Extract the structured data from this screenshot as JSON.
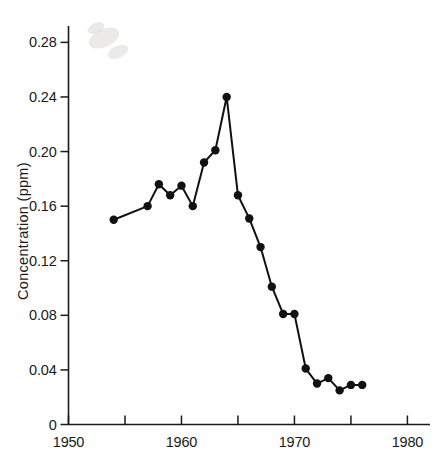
{
  "chart_data": {
    "type": "line",
    "title": "",
    "subtitle": "",
    "xlabel": "",
    "ylabel": "Concentration  (ppm)",
    "xlim": [
      1950,
      1982
    ],
    "ylim": [
      0,
      0.292
    ],
    "grid": false,
    "legend": null,
    "x_ticks_major": [
      1950,
      1960,
      1970,
      1980
    ],
    "x_tick_labels": [
      "1950",
      "1960",
      "1970",
      "1980"
    ],
    "x_ticks_minor": [
      1955,
      1965,
      1975
    ],
    "y_ticks": [
      0,
      0.04,
      0.08,
      0.12,
      0.16,
      0.2,
      0.24,
      0.28
    ],
    "y_tick_labels": [
      "0",
      "0.04",
      "0.08",
      "0.12",
      "0.16",
      "0.20",
      "0.24",
      "0.28"
    ],
    "series": [
      {
        "name": "Concentration",
        "marker": "filled-circle",
        "color": "#111111",
        "x": [
          1954,
          1957,
          1958,
          1959,
          1960,
          1961,
          1962,
          1963,
          1964,
          1965,
          1966,
          1967,
          1968,
          1969,
          1970,
          1971,
          1972,
          1973,
          1974,
          1975,
          1976
        ],
        "values": [
          0.15,
          0.16,
          0.176,
          0.168,
          0.175,
          0.16,
          0.192,
          0.201,
          0.24,
          0.168,
          0.151,
          0.13,
          0.101,
          0.081,
          0.081,
          0.041,
          0.03,
          0.034,
          0.025,
          0.029,
          0.029
        ]
      }
    ]
  },
  "axes": {
    "y_axis_name": "concentration-axis",
    "x_axis_name": "year-axis"
  }
}
